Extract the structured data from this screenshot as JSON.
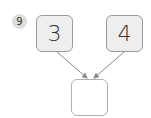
{
  "problem": {
    "number": "9"
  },
  "boxes": {
    "left": {
      "value": "3"
    },
    "right": {
      "value": "4"
    },
    "answer": {
      "value": ""
    }
  },
  "colors": {
    "badge_bg": "#dcdcdc",
    "box_fill": "#eeeeee",
    "box_border": "#9a9a9a",
    "arrow": "#8a8a8a",
    "text": "#333333"
  }
}
